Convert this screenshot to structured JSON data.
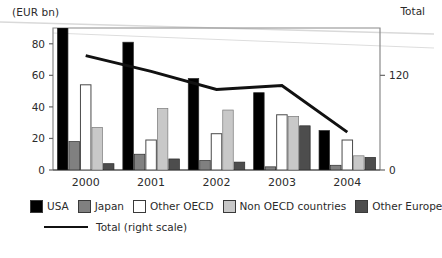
{
  "chart_data": {
    "type": "bar",
    "title": "",
    "subtitle": "",
    "unit_label": "(EUR bn)",
    "secondary_axis_label": "Total",
    "xlabel": "",
    "ylabel": "",
    "categories": [
      "2000",
      "2001",
      "2002",
      "2003",
      "2004"
    ],
    "ylim": [
      0,
      90
    ],
    "yticks": [
      0,
      20,
      40,
      60,
      80
    ],
    "ytick_labels": [
      "0",
      "20",
      "40",
      "60",
      "80"
    ],
    "y2lim": [
      0,
      180
    ],
    "y2ticks": [
      0,
      120
    ],
    "y2tick_labels": [
      "0",
      "120"
    ],
    "grid": false,
    "legend_position": "below",
    "series": [
      {
        "name": "USA",
        "color": "#000000",
        "values": [
          90,
          81,
          58,
          49,
          25
        ]
      },
      {
        "name": "Japan",
        "color": "#808080",
        "values": [
          18,
          10,
          6,
          2,
          3
        ]
      },
      {
        "name": "Other OECD",
        "color": "#ffffff",
        "values": [
          54,
          19,
          23,
          35,
          19
        ]
      },
      {
        "name": "Non OECD countries",
        "color": "#c8c8c8",
        "values": [
          27,
          39,
          38,
          34,
          9
        ]
      },
      {
        "name": "Other Europe",
        "color": "#4d4d4d",
        "values": [
          4,
          7,
          5,
          28,
          8
        ]
      }
    ],
    "line_series": {
      "name": "Total (right scale)",
      "color": "#111111",
      "axis": "right",
      "values": [
        145,
        125,
        102,
        107,
        48
      ]
    },
    "annotations": []
  },
  "legend": {
    "items": [
      {
        "label": "USA"
      },
      {
        "label": "Japan"
      },
      {
        "label": "Other OECD"
      },
      {
        "label": "Non OECD countries"
      },
      {
        "label": "Other Europe"
      }
    ],
    "line_entry": "Total (right scale)"
  }
}
